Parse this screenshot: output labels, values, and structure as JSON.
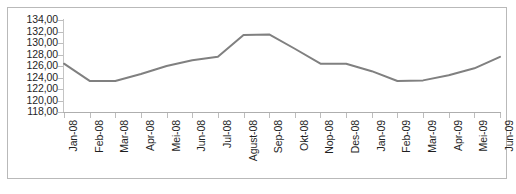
{
  "chart_data": {
    "type": "line",
    "title": "",
    "subtitle": "",
    "xlabel": "",
    "ylabel": "",
    "categories": [
      "Jan-08",
      "Feb-08",
      "Mar-08",
      "Apr-08",
      "Mei-08",
      "Jun-08",
      "Jul-08",
      "Agust-08",
      "Sep-08",
      "Okt-08",
      "Nop-08",
      "Des-08",
      "Jan-09",
      "Feb-09",
      "Mar-09",
      "Apr-09",
      "Mei-09",
      "Jun-09"
    ],
    "values": [
      126.4,
      123.4,
      123.4,
      124.6,
      126.0,
      127.0,
      127.6,
      131.4,
      131.5,
      129.0,
      126.4,
      126.4,
      125.1,
      123.4,
      123.5,
      124.4,
      125.6,
      127.6
    ],
    "series": [
      {
        "name": "IPR",
        "color": "#808080",
        "values": [
          126.4,
          123.4,
          123.4,
          124.6,
          126.0,
          127.0,
          127.6,
          131.4,
          131.5,
          129.0,
          126.4,
          126.4,
          125.1,
          123.4,
          123.5,
          124.4,
          125.6,
          127.6
        ]
      }
    ],
    "ylim": [
      118.0,
      134.0
    ],
    "ytick_step": 2.0,
    "ytick_labels": [
      "134,00",
      "132,00",
      "130,00",
      "128,00",
      "126,00",
      "124,00",
      "122,00",
      "120,00",
      "118,00"
    ],
    "ytick_values": [
      134.0,
      132.0,
      130.0,
      128.0,
      126.0,
      124.0,
      122.0,
      120.0,
      118.0
    ],
    "decimal_separator": ",",
    "grid": false,
    "legend": false,
    "legend_position": "none",
    "markers": false,
    "line_width": 2,
    "border_color": "#b9b9b9",
    "axis_color": "#bdbdbd",
    "background": "#ffffff"
  },
  "caption": {
    "text": ""
  }
}
